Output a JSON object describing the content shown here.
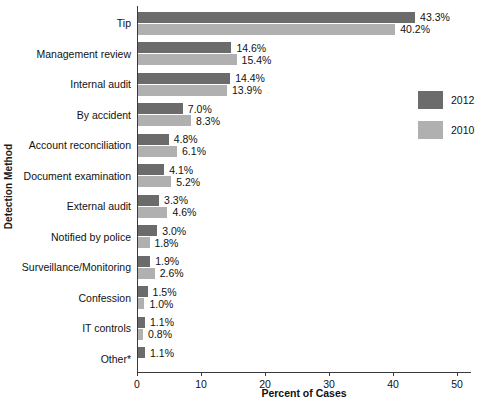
{
  "chart_data": {
    "type": "bar",
    "orientation": "horizontal",
    "title": "",
    "xlabel": "Percent of Cases",
    "ylabel": "Detection Method",
    "xlim": [
      0,
      50
    ],
    "xticks": [
      0,
      10,
      20,
      30,
      40,
      50
    ],
    "grid": false,
    "legend_position": "right",
    "categories": [
      "Tip",
      "Management review",
      "Internal audit",
      "By accident",
      "Account reconciliation",
      "Document examination",
      "External audit",
      "Notified by police",
      "Surveillance/Monitoring",
      "Confession",
      "IT controls",
      "Other*"
    ],
    "series": [
      {
        "name": "2012",
        "color": "#6b6b6b",
        "values": [
          43.3,
          14.6,
          14.4,
          7.0,
          4.8,
          4.1,
          3.3,
          3.0,
          1.9,
          1.5,
          1.1,
          1.1
        ],
        "labels": [
          "43.3%",
          "14.6%",
          "14.4%",
          "7.0%",
          "4.8%",
          "4.1%",
          "3.3%",
          "3.0%",
          "1.9%",
          "1.5%",
          "1.1%",
          "1.1%"
        ]
      },
      {
        "name": "2010",
        "color": "#b0b0b0",
        "values": [
          40.2,
          15.4,
          13.9,
          8.3,
          6.1,
          5.2,
          4.6,
          1.8,
          2.6,
          1.0,
          0.8,
          null
        ],
        "labels": [
          "40.2%",
          "15.4%",
          "13.9%",
          "8.3%",
          "6.1%",
          "5.2%",
          "4.6%",
          "1.8%",
          "2.6%",
          "1.0%",
          "0.8%",
          ""
        ]
      }
    ]
  },
  "axes": {
    "x_title": "Percent of Cases",
    "y_title": "Detection Method",
    "x_tick_labels": [
      "0",
      "10",
      "20",
      "30",
      "40",
      "50"
    ]
  },
  "legend": {
    "items": [
      {
        "label": "2012",
        "color": "#6b6b6b"
      },
      {
        "label": "2010",
        "color": "#b0b0b0"
      }
    ]
  }
}
